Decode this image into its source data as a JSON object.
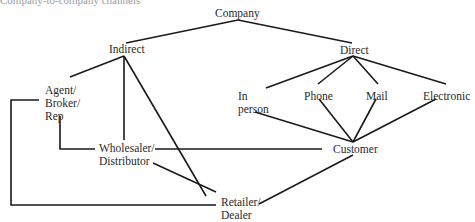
{
  "caption": "Company-to-company channels",
  "nodes": {
    "company": {
      "lines": [
        "Company"
      ]
    },
    "indirect": {
      "lines": [
        "Indirect"
      ]
    },
    "direct": {
      "lines": [
        "Direct"
      ]
    },
    "agent": {
      "lines": [
        "Agent/",
        "Broker/",
        "Rep"
      ]
    },
    "in_person": {
      "lines": [
        "In",
        "person"
      ]
    },
    "phone": {
      "lines": [
        "Phone"
      ]
    },
    "mail": {
      "lines": [
        "Mail"
      ]
    },
    "electronic": {
      "lines": [
        "Electronic"
      ]
    },
    "wholesaler": {
      "lines": [
        "Wholesaler/",
        "Distributor"
      ]
    },
    "customer": {
      "lines": [
        "Customer"
      ]
    },
    "retailer": {
      "lines": [
        "Retailer/",
        "Dealer"
      ]
    }
  },
  "edges": [
    [
      "Company",
      "Indirect"
    ],
    [
      "Company",
      "Direct"
    ],
    [
      "Indirect",
      "Agent/Broker/Rep"
    ],
    [
      "Indirect",
      "Wholesaler/Distributor"
    ],
    [
      "Indirect",
      "Retailer/Dealer"
    ],
    [
      "Direct",
      "In person"
    ],
    [
      "Direct",
      "Phone"
    ],
    [
      "Direct",
      "Mail"
    ],
    [
      "Direct",
      "Electronic"
    ],
    [
      "In person",
      "Customer"
    ],
    [
      "Phone",
      "Customer"
    ],
    [
      "Mail",
      "Customer"
    ],
    [
      "Electronic",
      "Customer"
    ],
    [
      "Agent/Broker/Rep",
      "Wholesaler/Distributor"
    ],
    [
      "Agent/Broker/Rep",
      "Retailer/Dealer"
    ],
    [
      "Wholesaler/Distributor",
      "Customer"
    ],
    [
      "Wholesaler/Distributor",
      "Retailer/Dealer"
    ],
    [
      "Retailer/Dealer",
      "Customer"
    ]
  ]
}
